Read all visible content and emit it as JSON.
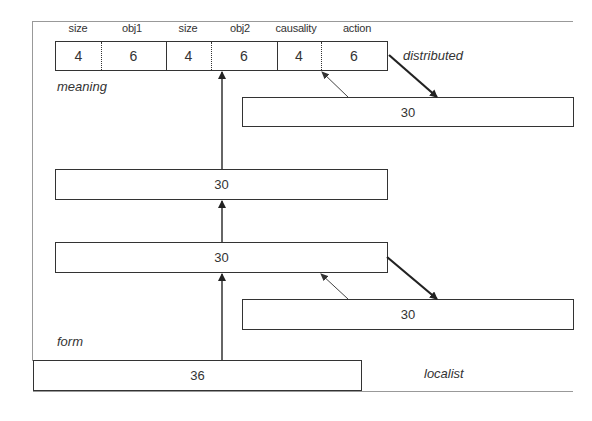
{
  "diagram": {
    "title": "",
    "meaning_layer": {
      "label": "meaning",
      "annotation": "distributed",
      "fields": [
        {
          "header": "size",
          "value": "4"
        },
        {
          "header": "obj1",
          "value": "6"
        },
        {
          "header": "size",
          "value": "4"
        },
        {
          "header": "obj2",
          "value": "6"
        },
        {
          "header": "causality",
          "value": "4"
        },
        {
          "header": "action",
          "value": "6"
        }
      ]
    },
    "meaning_context_layer": {
      "value": "30"
    },
    "hidden_layer_upper": {
      "value": "30"
    },
    "hidden_layer_lower": {
      "value": "30"
    },
    "form_context_layer": {
      "value": "30"
    },
    "form_layer": {
      "label": "form",
      "annotation": "localist",
      "value": "36"
    },
    "colors": {
      "line": "#333333",
      "frame": "#999999",
      "background": "#ffffff"
    }
  }
}
